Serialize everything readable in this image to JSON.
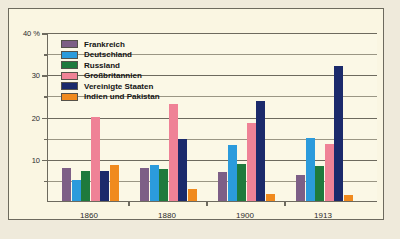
{
  "chart_data": {
    "type": "bar",
    "title": "",
    "xlabel": "",
    "ylabel": "40 %",
    "categories": [
      "1860",
      "1880",
      "1900",
      "1913"
    ],
    "ylim": [
      0,
      40
    ],
    "yticks": [
      10,
      20,
      30,
      40
    ],
    "ytick_labels": [
      "10",
      "20",
      "30",
      "40 %"
    ],
    "minor_yticks": [
      5,
      15,
      25,
      35
    ],
    "grid": true,
    "legend_position": "top-left",
    "series": [
      {
        "name": "Frankreich",
        "color": "#7d5f86",
        "values": [
          7.9,
          7.8,
          6.8,
          6.1
        ]
      },
      {
        "name": "Deutschland",
        "color": "#2b9bdc",
        "values": [
          4.9,
          8.5,
          13.2,
          14.8
        ]
      },
      {
        "name": "Russland",
        "color": "#1f7a3d",
        "values": [
          7.0,
          7.6,
          8.8,
          8.2
        ]
      },
      {
        "name": "Großbritannien",
        "color": "#ef8296",
        "values": [
          19.9,
          22.9,
          18.5,
          13.6
        ]
      },
      {
        "name": "Vereinigte Staaten",
        "color": "#1b2a6b",
        "values": [
          7.2,
          14.7,
          23.6,
          32.0
        ]
      },
      {
        "name": "Indien und Pakistan",
        "color": "#f08a1e",
        "values": [
          8.6,
          2.8,
          1.7,
          1.4
        ]
      }
    ]
  }
}
